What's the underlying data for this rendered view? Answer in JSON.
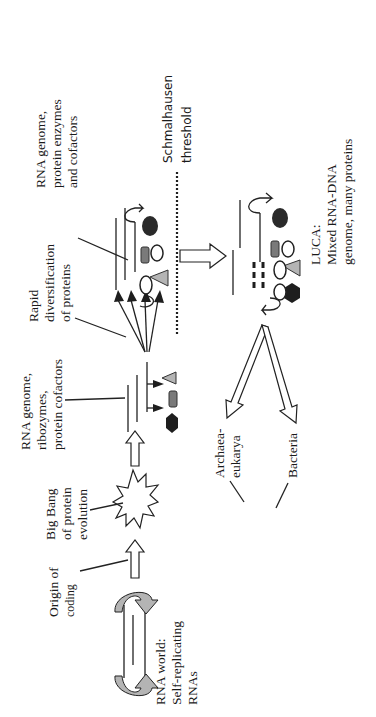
{
  "figure": {
    "orientation": "rotated 90 degrees counter-clockwise",
    "stages": [
      {
        "id": "rna_world",
        "label_lines": [
          "RNA world:",
          "Self-replicating",
          "RNAs"
        ]
      },
      {
        "id": "origin_coding",
        "label_lines": [
          "Origin of",
          "coding"
        ]
      },
      {
        "id": "big_bang",
        "label_lines": [
          "Big Bang",
          "of protein",
          "evolution"
        ]
      },
      {
        "id": "rna_ribozymes",
        "label_lines": [
          "RNA genome,",
          "ribozymes,",
          "protein cofactors"
        ]
      },
      {
        "id": "rapid_div",
        "label_lines": [
          "Rapid",
          "diversification",
          "of proteins"
        ]
      },
      {
        "id": "rna_enzymes",
        "label_lines": [
          "RNA genome,",
          "protein enzymes",
          "and cofactors"
        ]
      },
      {
        "id": "threshold",
        "label_lines": [
          "Schmalhausen",
          "threshold"
        ]
      },
      {
        "id": "luca",
        "label_lines": [
          "LUCA:",
          "Mixed RNA-DNA",
          "genome, many proteins"
        ]
      },
      {
        "id": "archaea",
        "label_lines": [
          "Archaea-",
          "eukarya"
        ]
      },
      {
        "id": "bacteria",
        "label_lines": [
          "Bacteria"
        ]
      }
    ],
    "colors": {
      "line": "#222222",
      "light_gray": "#b4b4b4",
      "mid_gray": "#7a7a7a",
      "dark": "#1e1e1e"
    }
  }
}
